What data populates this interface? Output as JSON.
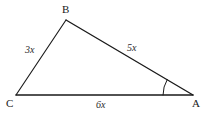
{
  "figure": {
    "type": "geometry-diagram",
    "shape": "triangle",
    "background_color": "#ffffff",
    "stroke_color": "#1a1a1a",
    "label_color": "#1a1a1a"
  },
  "vertices": [
    {
      "id": "B",
      "label": "B",
      "x": 66,
      "y": 20
    },
    {
      "id": "C",
      "label": "C",
      "x": 16,
      "y": 95
    },
    {
      "id": "A",
      "label": "A",
      "x": 193,
      "y": 95
    }
  ],
  "sides": [
    {
      "id": "CB",
      "label": "3x",
      "from": "C",
      "to": "B"
    },
    {
      "id": "BA",
      "label": "5x",
      "from": "B",
      "to": "A"
    },
    {
      "id": "CA",
      "label": "6x",
      "from": "C",
      "to": "A"
    }
  ],
  "angle_marks": [
    {
      "at": "A",
      "type": "single-arc",
      "label": ""
    }
  ]
}
